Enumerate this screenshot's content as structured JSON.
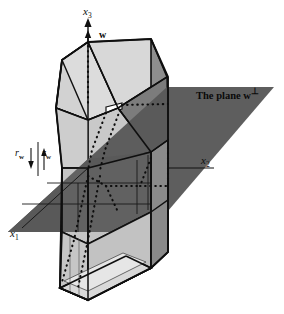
{
  "figure": {
    "name": "polytope-cut-by-hyperplane",
    "labels": {
      "axis_x3": "x",
      "axis_x3_sub": "3",
      "axis_x2": "x",
      "axis_x2_sub": "2",
      "axis_x1": "x",
      "axis_x1_sub": "1",
      "vector_w": "w",
      "plane_text": "The plane w",
      "plane_perp": "⊥",
      "radius_left": "r",
      "radius_left_sub": "w",
      "radius_right": "r",
      "radius_right_sub": "w"
    },
    "colors": {
      "background": "#ffffff",
      "plane_fill": "#595959",
      "face_light": "#cacaca",
      "face_light2": "#d6d6d6",
      "face_mid": "#8c8c8c",
      "face_mid_dark": "#6e6e6e",
      "face_pale": "#e4e4e4",
      "outline": "#111111",
      "thin_line": "#4a4a4a",
      "dotted": "#0d0d0d"
    },
    "geometry": {
      "axis_origin": [
        88,
        168
      ],
      "x3_arrow_tip": [
        88,
        22
      ],
      "prism_top_apex": [
        88,
        42
      ],
      "prism_bottom": [
        88,
        300
      ],
      "plane_quad": [
        [
          8,
          232
        ],
        [
          167,
          87
        ],
        [
          274,
          87
        ],
        [
          150,
          232
        ]
      ]
    }
  }
}
